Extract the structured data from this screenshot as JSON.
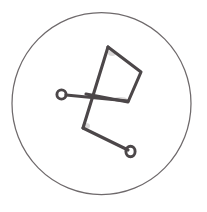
{
  "figure": {
    "width": 207,
    "height": 212,
    "background_color": "#ffffff",
    "stroke_color": "#4c4749",
    "circle_stroke_color": "#6e696b",
    "smudge_color": "#bdb9ba"
  },
  "enclosing_circle": {
    "name": "outer boundary circle",
    "center_x": 101.5,
    "center_y": 103.5,
    "radius_x": 89.5,
    "radius_y": 91.0,
    "stroke_width": 1.25
  },
  "strokes": [
    {
      "name": "quadrilateral-body",
      "kind": "polyline",
      "points": "108,47 141,72 128,102 86,94",
      "note": "Four-sided kite shape: apex top-left, right vertex, bottom-right vertex, left vertex"
    },
    {
      "name": "apex-down-left-limb",
      "kind": "polyline",
      "points": "108,47 83,128",
      "note": "Long stroke from the top apex descending left through the body to the lower bend"
    },
    {
      "name": "left-stem",
      "kind": "polyline",
      "points": "66,95 128,101",
      "note": "Near-horizontal stem from the left terminal node across to the bottom-right vertex"
    },
    {
      "name": "zigzag-tail",
      "kind": "polyline",
      "points": "83,128 128,150",
      "note": "Descending stroke from the lower bend to the lower-right terminal node"
    }
  ],
  "terminal_nodes": [
    {
      "name": "left-terminal-circle",
      "center_x": 61.5,
      "center_y": 94.5,
      "radius_x": 4.6,
      "radius_y": 4.6
    },
    {
      "name": "lower-right-terminal-circle",
      "center_x": 130.5,
      "center_y": 151.5,
      "radius_x": 4.6,
      "radius_y": 5.2
    }
  ],
  "smudges": [
    {
      "name": "smudge-upper-inner",
      "cx": 112,
      "cy": 53,
      "rx": 4,
      "ry": 3
    },
    {
      "name": "smudge-mid-right",
      "cx": 120,
      "cy": 99,
      "rx": 7,
      "ry": 2
    },
    {
      "name": "smudge-lower-left",
      "cx": 86,
      "cy": 126,
      "rx": 4,
      "ry": 3
    }
  ]
}
